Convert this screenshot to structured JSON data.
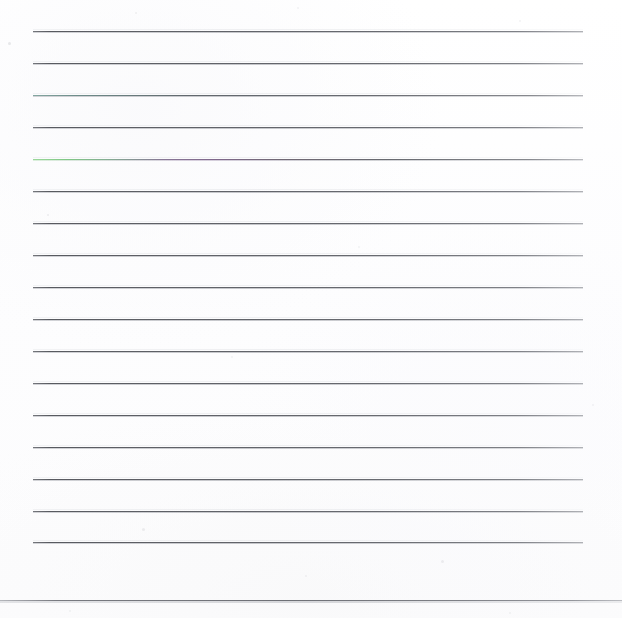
{
  "document": {
    "kind": "scanned-lined-paper",
    "title": "Blank ruled page",
    "width": 622,
    "height": 618,
    "background_color": "#fefefe",
    "has_text_content": false,
    "note": ""
  },
  "ruling": {
    "line_count": 17,
    "left_edge": 33,
    "right_edge": 583,
    "first_line_y": 31,
    "spacing": 31.9,
    "line_color": "#5e6066",
    "halo_color": "#aeb0b6",
    "lines": [
      {
        "index": 1,
        "y": 31,
        "left": 33,
        "right": 583,
        "tint": "neutral"
      },
      {
        "index": 2,
        "y": 63,
        "left": 33,
        "right": 583,
        "tint": "neutral"
      },
      {
        "index": 3,
        "y": 95,
        "left": 33,
        "right": 583,
        "tint": "teal"
      },
      {
        "index": 4,
        "y": 127,
        "left": 33,
        "right": 583,
        "tint": "neutral"
      },
      {
        "index": 5,
        "y": 159,
        "left": 33,
        "right": 583,
        "tint": "green-magenta"
      },
      {
        "index": 6,
        "y": 191,
        "left": 33,
        "right": 583,
        "tint": "neutral"
      },
      {
        "index": 7,
        "y": 223,
        "left": 33,
        "right": 583,
        "tint": "neutral"
      },
      {
        "index": 8,
        "y": 255,
        "left": 33,
        "right": 583,
        "tint": "neutral"
      },
      {
        "index": 9,
        "y": 287,
        "left": 33,
        "right": 583,
        "tint": "neutral"
      },
      {
        "index": 10,
        "y": 319,
        "left": 33,
        "right": 583,
        "tint": "neutral"
      },
      {
        "index": 11,
        "y": 351,
        "left": 33,
        "right": 583,
        "tint": "neutral"
      },
      {
        "index": 12,
        "y": 383,
        "left": 33,
        "right": 583,
        "tint": "neutral"
      },
      {
        "index": 13,
        "y": 415,
        "left": 33,
        "right": 583,
        "tint": "neutral"
      },
      {
        "index": 14,
        "y": 447,
        "left": 33,
        "right": 583,
        "tint": "neutral"
      },
      {
        "index": 15,
        "y": 479,
        "left": 33,
        "right": 583,
        "tint": "neutral"
      },
      {
        "index": 16,
        "y": 511,
        "left": 33,
        "right": 583,
        "tint": "neutral"
      },
      {
        "index": 17,
        "y": 542,
        "left": 33,
        "right": 583,
        "tint": "neutral"
      }
    ]
  },
  "footer_rule": {
    "y": 600,
    "left": 0,
    "right": 622,
    "color": "#70727a"
  },
  "scan_artifacts": {
    "specks": [
      {
        "x": 8,
        "y": 42,
        "size": 3,
        "opacity": 0.16
      },
      {
        "x": 135,
        "y": 12,
        "size": 2,
        "opacity": 0.1
      },
      {
        "x": 297,
        "y": 7,
        "size": 2,
        "opacity": 0.09
      },
      {
        "x": 519,
        "y": 20,
        "size": 2,
        "opacity": 0.09
      },
      {
        "x": 47,
        "y": 214,
        "size": 2,
        "opacity": 0.11
      },
      {
        "x": 358,
        "y": 246,
        "size": 2,
        "opacity": 0.08
      },
      {
        "x": 231,
        "y": 356,
        "size": 2,
        "opacity": 0.08
      },
      {
        "x": 592,
        "y": 404,
        "size": 2,
        "opacity": 0.09
      },
      {
        "x": 142,
        "y": 528,
        "size": 3,
        "opacity": 0.12
      },
      {
        "x": 441,
        "y": 560,
        "size": 3,
        "opacity": 0.11
      },
      {
        "x": 305,
        "y": 575,
        "size": 2,
        "opacity": 0.09
      },
      {
        "x": 509,
        "y": 612,
        "size": 2,
        "opacity": 0.08
      },
      {
        "x": 69,
        "y": 610,
        "size": 2,
        "opacity": 0.08
      }
    ]
  }
}
